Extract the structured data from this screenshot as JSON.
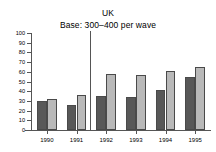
{
  "chart_data": {
    "type": "bar",
    "title": "UK",
    "subtitle": "Base: 300–400 per wave",
    "xlabel": "",
    "ylabel": "",
    "ylim": [
      0,
      100
    ],
    "ytick_step": 10,
    "yticks": [
      0,
      10,
      20,
      30,
      40,
      50,
      60,
      70,
      80,
      90,
      100
    ],
    "ytick_labels": [
      "0",
      "10",
      "20",
      "30",
      "40",
      "50",
      "60",
      "70",
      "80",
      "90",
      "100"
    ],
    "categories": [
      "1990",
      "1991",
      "1992",
      "1993",
      "1994",
      "1995"
    ],
    "grid": false,
    "legend": "none",
    "annotations": [
      {
        "type": "vertical-divider",
        "between": [
          "1991",
          "1992"
        ],
        "note": "solid vertical rule separating 1990-1991 from 1992-1995"
      }
    ],
    "series": [
      {
        "name": "series-1",
        "color": "#585858",
        "values": [
          30,
          26,
          35,
          34,
          41,
          55
        ]
      },
      {
        "name": "series-2",
        "color": "#b9b9b9",
        "values": [
          32,
          36,
          58,
          57,
          61,
          65
        ]
      }
    ]
  },
  "colors": {
    "series_dark": "#585858",
    "series_light": "#b9b9b9",
    "axis": "#555555",
    "text": "#000000",
    "background": "#ffffff"
  }
}
